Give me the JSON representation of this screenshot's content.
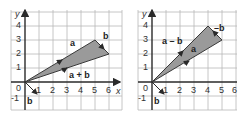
{
  "panels": [
    {
      "id": "sum",
      "origin_px": [
        25,
        82
      ],
      "axes": {
        "x_label": "x",
        "y_label": "y"
      },
      "x_ticks": [
        "1",
        "2",
        "3",
        "4",
        "5",
        "6"
      ],
      "y_ticks": [
        "4",
        "3",
        "2",
        "1",
        "0",
        "-1"
      ],
      "vectors": {
        "a": {
          "label": "a",
          "from": [
            0,
            0
          ],
          "to": [
            5,
            3
          ]
        },
        "b_at_origin": {
          "label": "b",
          "from": [
            0,
            0
          ],
          "to": [
            1,
            -1
          ]
        },
        "b_at_tip": {
          "label": "b",
          "from": [
            5,
            3
          ],
          "to": [
            6,
            2
          ]
        },
        "result": {
          "label": "a + b",
          "from": [
            0,
            0
          ],
          "to": [
            6,
            2
          ]
        }
      }
    },
    {
      "id": "difference",
      "origin_px": [
        152,
        82
      ],
      "axes": {
        "x_label": "x",
        "y_label": "y"
      },
      "x_ticks": [
        "1",
        "2",
        "3",
        "4",
        "5",
        "6"
      ],
      "y_ticks": [
        "4",
        "3",
        "2",
        "1",
        "0",
        "-1"
      ],
      "vectors": {
        "a": {
          "label": "a",
          "from": [
            0,
            0
          ],
          "to": [
            5,
            3
          ]
        },
        "b_at_origin": {
          "label": "b",
          "from": [
            0,
            0
          ],
          "to": [
            1,
            -1
          ]
        },
        "neg_b_at_tip": {
          "label": "–b",
          "from": [
            5,
            3
          ],
          "to": [
            4,
            4
          ]
        },
        "result": {
          "label": "a – b",
          "from": [
            0,
            0
          ],
          "to": [
            4,
            4
          ]
        }
      }
    }
  ],
  "colors": {
    "fill": "#9a9a9a",
    "grid": "#b8b8b8",
    "axis": "#2a2a2a"
  }
}
